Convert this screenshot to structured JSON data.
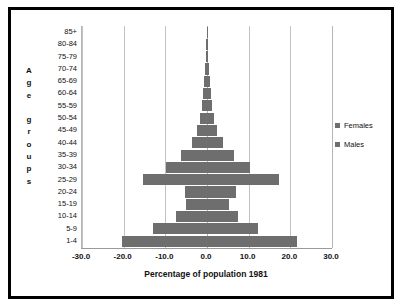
{
  "chart_data": {
    "type": "bar",
    "title": "",
    "xlabel": "Percentage of population 1981",
    "ylabel": "Age groups",
    "orientation": "horizontal",
    "style": "population-pyramid",
    "grid": true,
    "legend_position": "right",
    "xlim": [
      -30.0,
      30.0
    ],
    "xticks": [
      "-30.0",
      "-20.0",
      "-10.0",
      "0.0",
      "10.0",
      "20.0",
      "30.0"
    ],
    "xtick_values": [
      -30.0,
      -20.0,
      -10.0,
      0.0,
      10.0,
      20.0,
      30.0
    ],
    "categories": [
      "85+",
      "80-84",
      "75-79",
      "70-74",
      "65-69",
      "60-64",
      "55-59",
      "50-54",
      "45-49",
      "40-44",
      "35-39",
      "30-34",
      "25-29",
      "20-24",
      "15-19",
      "10-14",
      "5-9",
      "1-4"
    ],
    "series": [
      {
        "name": "Males",
        "side": "left",
        "color": "#6e6e6e",
        "values": [
          -0.1,
          -0.2,
          -0.3,
          -0.5,
          -0.7,
          -0.9,
          -1.2,
          -1.6,
          -2.3,
          -3.6,
          -6.2,
          -9.8,
          -15.3,
          -5.2,
          -5.1,
          -7.4,
          -13.0,
          -20.5
        ]
      },
      {
        "name": "Females",
        "side": "right",
        "color": "#6e6e6e",
        "values": [
          0.1,
          0.2,
          0.3,
          0.5,
          0.7,
          0.9,
          1.2,
          1.6,
          2.3,
          3.8,
          6.4,
          10.2,
          17.2,
          7.0,
          5.2,
          7.4,
          12.3,
          21.5
        ]
      }
    ]
  },
  "axis_title_y_letters": [
    "A",
    "g",
    "e",
    "",
    "g",
    "r",
    "o",
    "u",
    "p",
    "s"
  ],
  "legend": {
    "items": [
      {
        "label": "Females",
        "color": "#6e6e6e",
        "swatch": "square-marker"
      },
      {
        "label": "Males",
        "color": "#6e6e6e",
        "swatch": "square-marker"
      }
    ]
  },
  "colors": {
    "bar_fill": "#6e6e6e",
    "frame_border": "#000000",
    "plot_background": "#ffffff",
    "gridline": "#c3c3c3",
    "text": "#111111"
  }
}
